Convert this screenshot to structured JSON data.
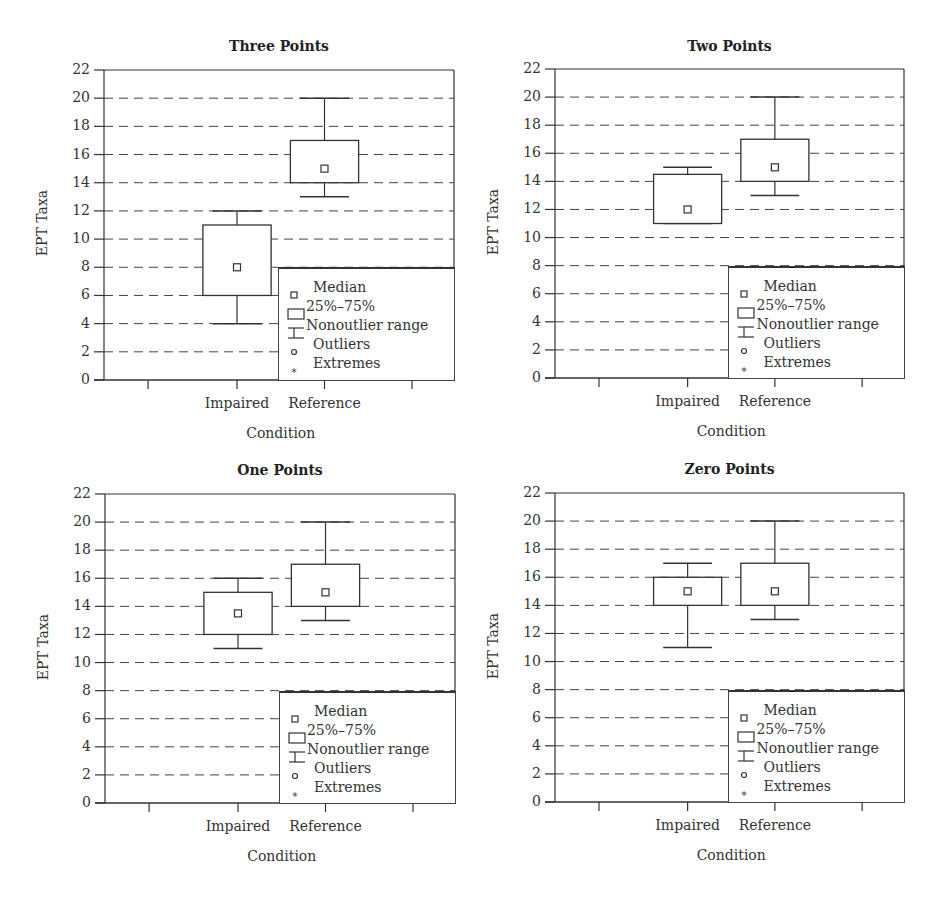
{
  "chart_data": [
    {
      "type": "box",
      "title": "Three Points",
      "xlabel": "Condition",
      "ylabel": "EPT Taxa",
      "ylim": [
        0,
        22
      ],
      "yticks": [
        0,
        2,
        4,
        6,
        8,
        10,
        12,
        14,
        16,
        18,
        20,
        22
      ],
      "categories": [
        "Impaired",
        "Reference"
      ],
      "grid": "dashed horizontal",
      "legend_position": "lower right",
      "boxes": [
        {
          "category": "Impaired",
          "min": 4,
          "q1": 6,
          "median": 8,
          "q3": 11,
          "max": 12
        },
        {
          "category": "Reference",
          "min": 13,
          "q1": 14,
          "median": 15,
          "q3": 17,
          "max": 20
        }
      ]
    },
    {
      "type": "box",
      "title": "Two Points",
      "xlabel": "Condition",
      "ylabel": "EPT Taxa",
      "ylim": [
        0,
        22
      ],
      "yticks": [
        0,
        2,
        4,
        6,
        8,
        10,
        12,
        14,
        16,
        18,
        20,
        22
      ],
      "categories": [
        "Impaired",
        "Reference"
      ],
      "grid": "dashed horizontal",
      "legend_position": "lower right",
      "boxes": [
        {
          "category": "Impaired",
          "min": 11,
          "q1": 11,
          "median": 12,
          "q3": 14.5,
          "max": 15
        },
        {
          "category": "Reference",
          "min": 13,
          "q1": 14,
          "median": 15,
          "q3": 17,
          "max": 20
        }
      ]
    },
    {
      "type": "box",
      "title": "One Points",
      "xlabel": "Condition",
      "ylabel": "EPT Taxa",
      "ylim": [
        0,
        22
      ],
      "yticks": [
        0,
        2,
        4,
        6,
        8,
        10,
        12,
        14,
        16,
        18,
        20,
        22
      ],
      "categories": [
        "Impaired",
        "Reference"
      ],
      "grid": "dashed horizontal",
      "legend_position": "lower right",
      "boxes": [
        {
          "category": "Impaired",
          "min": 11,
          "q1": 12,
          "median": 13.5,
          "q3": 15,
          "max": 16
        },
        {
          "category": "Reference",
          "min": 13,
          "q1": 14,
          "median": 15,
          "q3": 17,
          "max": 20
        }
      ]
    },
    {
      "type": "box",
      "title": "Zero Points",
      "xlabel": "Condition",
      "ylabel": "EPT Taxa",
      "ylim": [
        0,
        22
      ],
      "yticks": [
        0,
        2,
        4,
        6,
        8,
        10,
        12,
        14,
        16,
        18,
        20,
        22
      ],
      "categories": [
        "Impaired",
        "Reference"
      ],
      "grid": "dashed horizontal",
      "legend_position": "lower right",
      "boxes": [
        {
          "category": "Impaired",
          "min": 11,
          "q1": 14,
          "median": 15,
          "q3": 16,
          "max": 17
        },
        {
          "category": "Reference",
          "min": 13,
          "q1": 14,
          "median": 15,
          "q3": 17,
          "max": 20
        }
      ]
    }
  ],
  "legend": {
    "items": [
      {
        "symbol": "median-square",
        "label": "Median"
      },
      {
        "symbol": "box-rect",
        "label": "25%–75%"
      },
      {
        "symbol": "whisker",
        "label": "Nonoutlier range"
      },
      {
        "symbol": "circle",
        "label": "Outliers"
      },
      {
        "symbol": "asterisk",
        "label": "Extremes"
      }
    ]
  }
}
